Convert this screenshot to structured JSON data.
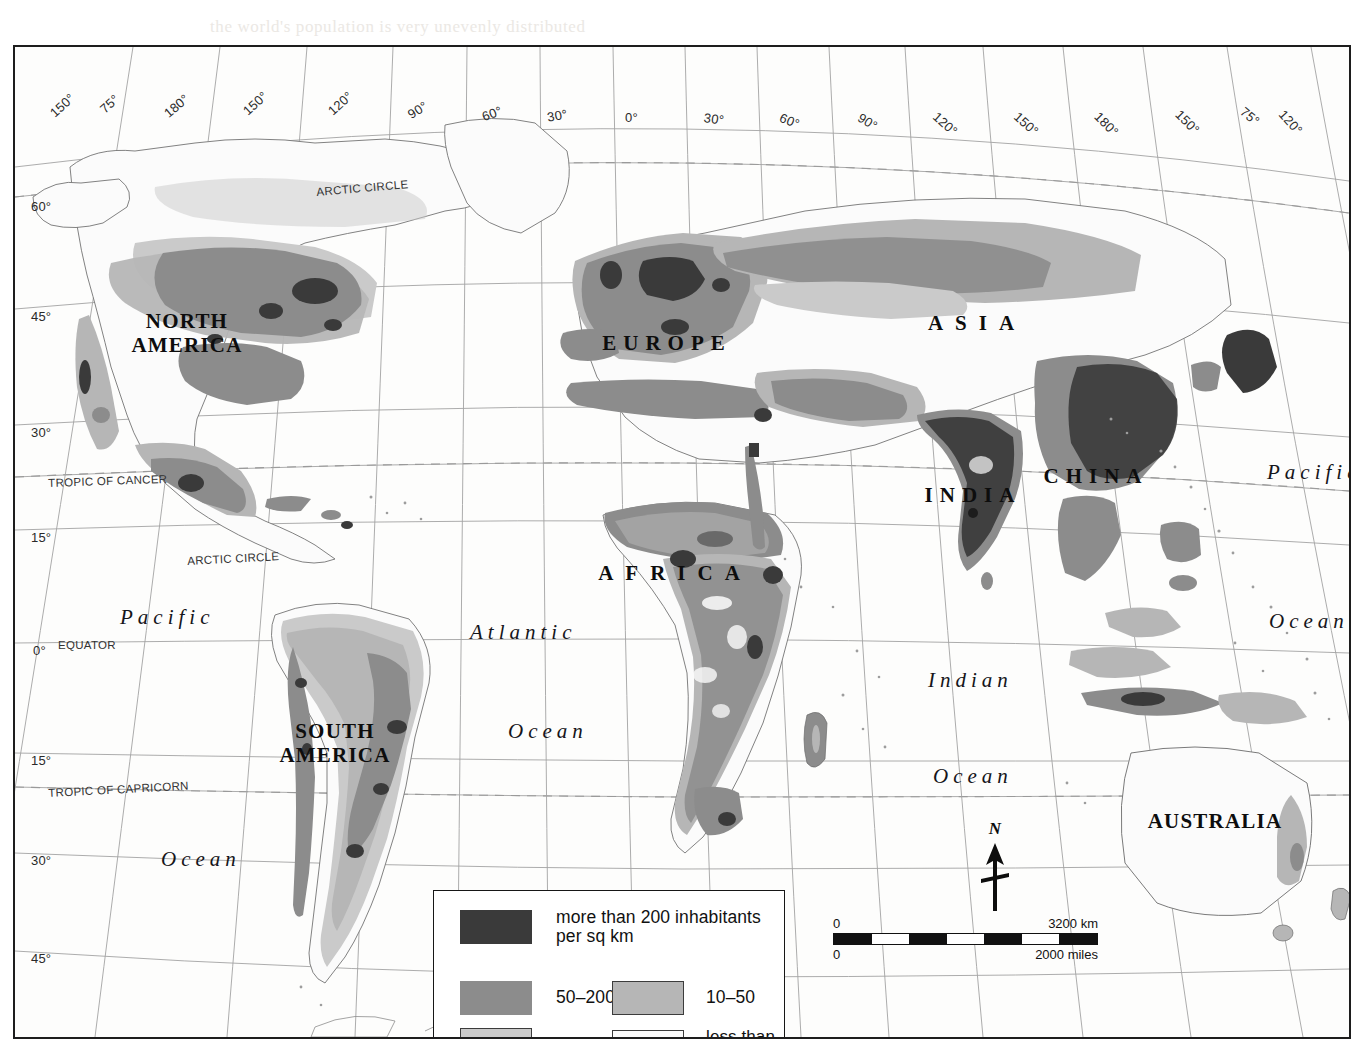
{
  "map": {
    "title": "World Population Density",
    "projection_note": "pseudo-conic world map"
  },
  "continents": [
    {
      "name": "NORTH AMERICA",
      "lines": [
        "NORTH",
        "AMERICA"
      ],
      "x": 172,
      "y": 263
    },
    {
      "name": "SOUTH AMERICA",
      "lines": [
        "SOUTH",
        "AMERICA"
      ],
      "x": 320,
      "y": 673
    },
    {
      "name": "EUROPE",
      "lines": [
        "EUROPE"
      ],
      "x": 652,
      "y": 285
    },
    {
      "name": "AFRICA",
      "lines": [
        "AFRICA"
      ],
      "x": 660,
      "y": 515
    },
    {
      "name": "ASIA",
      "lines": [
        "ASIA"
      ],
      "x": 962,
      "y": 265
    },
    {
      "name": "INDIA",
      "lines": [
        "INDIA"
      ],
      "x": 958,
      "y": 437
    },
    {
      "name": "CHINA",
      "lines": [
        "CHINA"
      ],
      "x": 1081,
      "y": 418
    },
    {
      "name": "AUSTRALIA",
      "lines": [
        "AUSTRALIA"
      ],
      "x": 1200,
      "y": 763
    }
  ],
  "oceans": [
    {
      "label": "Pacific",
      "x": 105,
      "y": 558
    },
    {
      "label": "Ocean",
      "x": 146,
      "y": 800
    },
    {
      "label": "Atlantic",
      "x": 455,
      "y": 573
    },
    {
      "label": "Ocean",
      "x": 493,
      "y": 672
    },
    {
      "label": "Indian",
      "x": 913,
      "y": 621
    },
    {
      "label": "Ocean",
      "x": 918,
      "y": 717
    },
    {
      "label": "Pacific",
      "x": 1252,
      "y": 413
    },
    {
      "label": "Ocean",
      "x": 1254,
      "y": 562
    }
  ],
  "graticule": {
    "top_longitudes": [
      "150°",
      "75°",
      "180°",
      "150°",
      "120°",
      "90°",
      "60°",
      "30°",
      "0°",
      "30°",
      "60°",
      "90°",
      "120°",
      "150°",
      "180°",
      "150°",
      "75°",
      "120°"
    ],
    "left_latitudes": [
      "60°",
      "45°",
      "30°",
      "15°",
      "0°",
      "15°",
      "30°",
      "45°",
      "60°"
    ],
    "special_lines": [
      "ARCTIC CIRCLE",
      "TROPIC OF CANCER",
      "EQUATOR",
      "TROPIC OF CAPRICORN",
      "ANTARCTIC CIRCLE"
    ]
  },
  "graticule_labels_top": [
    {
      "text": "150°",
      "x": 32,
      "y": 62,
      "rot": -42
    },
    {
      "text": "75°",
      "x": 82,
      "y": 58,
      "rot": -42
    },
    {
      "text": "180°",
      "x": 146,
      "y": 62,
      "rot": -40
    },
    {
      "text": "150°",
      "x": 225,
      "y": 60,
      "rot": -42
    },
    {
      "text": "120°",
      "x": 310,
      "y": 60,
      "rot": -42
    },
    {
      "text": "90°",
      "x": 390,
      "y": 62,
      "rot": -32
    },
    {
      "text": "60°",
      "x": 465,
      "y": 63,
      "rot": -20
    },
    {
      "text": "30°",
      "x": 531,
      "y": 63,
      "rot": -10
    },
    {
      "text": "0°",
      "x": 610,
      "y": 63,
      "rot": 0
    },
    {
      "text": "30°",
      "x": 690,
      "y": 63,
      "rot": 8
    },
    {
      "text": "60°",
      "x": 768,
      "y": 63,
      "rot": 22
    },
    {
      "text": "90°",
      "x": 848,
      "y": 63,
      "rot": 32
    },
    {
      "text": "120°",
      "x": 925,
      "y": 62,
      "rot": 42
    },
    {
      "text": "150°",
      "x": 1006,
      "y": 62,
      "rot": 42
    },
    {
      "text": "180°",
      "x": 1087,
      "y": 62,
      "rot": 45
    },
    {
      "text": "150°",
      "x": 1168,
      "y": 60,
      "rot": 45
    },
    {
      "text": "75°",
      "x": 1232,
      "y": 57,
      "rot": 40
    },
    {
      "text": "120°",
      "x": 1272,
      "y": 60,
      "rot": 48
    }
  ],
  "graticule_labels_left": [
    {
      "text": "60°",
      "x": 16,
      "y": 152
    },
    {
      "text": "45°",
      "x": 16,
      "y": 262
    },
    {
      "text": "30°",
      "x": 16,
      "y": 378
    },
    {
      "text": "15°",
      "x": 16,
      "y": 483
    },
    {
      "text": "0°",
      "x": 18,
      "y": 596
    },
    {
      "text": "15°",
      "x": 16,
      "y": 706
    },
    {
      "text": "30°",
      "x": 16,
      "y": 806
    },
    {
      "text": "45°",
      "x": 16,
      "y": 904
    },
    {
      "text": "60°",
      "x": 16,
      "y": 1017
    }
  ],
  "named_lines": [
    {
      "text": "ARCTIC CIRCLE",
      "x": 301,
      "y": 139,
      "rot": -5
    },
    {
      "text": "TROPIC OF CANCER",
      "x": 33,
      "y": 430,
      "rot": -2
    },
    {
      "text": "EQUATOR",
      "x": 43,
      "y": 592,
      "rot": 0
    },
    {
      "text": "ARCTIC CIRCLE",
      "x": 172,
      "y": 508,
      "rot": -3
    },
    {
      "text": "TROPIC OF CAPRICORN",
      "x": 33,
      "y": 740,
      "rot": -3
    },
    {
      "text": "ANTARCTIC CIRCLE",
      "x": 244,
      "y": 1021,
      "rot": -6
    }
  ],
  "legend": {
    "items": [
      {
        "id": "cat-over-200",
        "label": "more than 200 inhabitants per sq km",
        "label_line1": "more than 200 inhabitants",
        "label_line2": "per sq km",
        "color": "#3a3a3a",
        "bordered": false
      },
      {
        "id": "cat-50-200",
        "label": "50–200",
        "color": "#8c8c8c",
        "bordered": false
      },
      {
        "id": "cat-10-50",
        "label": "10–50",
        "color": "#b6b6b6",
        "bordered": true
      },
      {
        "id": "cat-1-10",
        "label": "1–10",
        "color": "#cacaca",
        "bordered": true
      },
      {
        "id": "cat-under-1",
        "label": "less than 1",
        "color": "#fbfbfb",
        "bordered": true
      }
    ]
  },
  "scalebar": {
    "zero_top": "0",
    "zero_bottom": "0",
    "km_label": "3200 km",
    "miles_label": "2000 miles"
  },
  "compass": {
    "north_label": "N"
  },
  "colors": {
    "density_over_200": "#3a3a3a",
    "density_50_200": "#8c8c8c",
    "density_10_50": "#b6b6b6",
    "density_1_10": "#cacaca",
    "density_under_1": "#fbfbfb",
    "coastline": "#6b6b6b",
    "graticule": "#9a9a9a",
    "frame": "#1d1d1d",
    "paper": "#ffffff"
  },
  "ghost_text": [
    {
      "text": "the world's population is very unevenly distributed",
      "x": 210,
      "y": 17
    },
    {
      "text": "population density",
      "x": 400,
      "y": 230
    },
    {
      "text": "the number of people living in an area",
      "x": 330,
      "y": 437
    },
    {
      "text": "largest cities of more than a million people",
      "x": 390,
      "y": 812
    }
  ]
}
